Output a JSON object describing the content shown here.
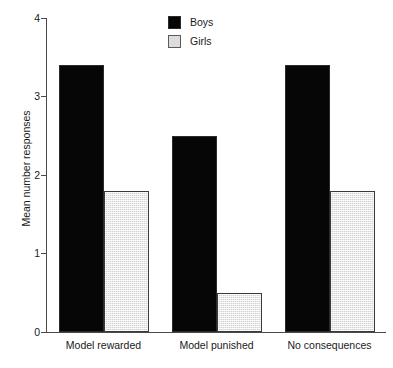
{
  "chart_data": {
    "type": "bar",
    "title": "",
    "subtitle": "",
    "xlabel": "",
    "ylabel": "Mean number responses",
    "categories": [
      "Model rewarded",
      "Model punished",
      "No consequences"
    ],
    "series": [
      {
        "name": "Boys",
        "values": [
          3.4,
          2.5,
          3.4
        ],
        "color": "#060606"
      },
      {
        "name": "Girls",
        "values": [
          1.8,
          0.5,
          1.8
        ],
        "color": "#d2d2d2"
      }
    ],
    "ylim": [
      0,
      4
    ],
    "yticks": [
      0,
      1,
      2,
      3,
      4
    ],
    "ytick_labels": [
      "0",
      "1",
      "2",
      "3",
      "4"
    ],
    "grid": false,
    "legend_position": "top-center",
    "legend_entries": [
      "Boys",
      "Girls"
    ]
  },
  "axes": {
    "y_title": "Mean number responses",
    "y_ticks": [
      {
        "value": 4,
        "label": "4"
      },
      {
        "value": 3,
        "label": "3"
      },
      {
        "value": 2,
        "label": "2"
      },
      {
        "value": 1,
        "label": "1"
      },
      {
        "value": 0,
        "label": "0"
      }
    ],
    "x_labels": [
      "Model rewarded",
      "Model punished",
      "No consequences"
    ]
  },
  "legend": {
    "items": [
      {
        "label": "Boys",
        "swatch": "solid-black-square"
      },
      {
        "label": "Girls",
        "swatch": "hatched-gray-square"
      }
    ]
  }
}
